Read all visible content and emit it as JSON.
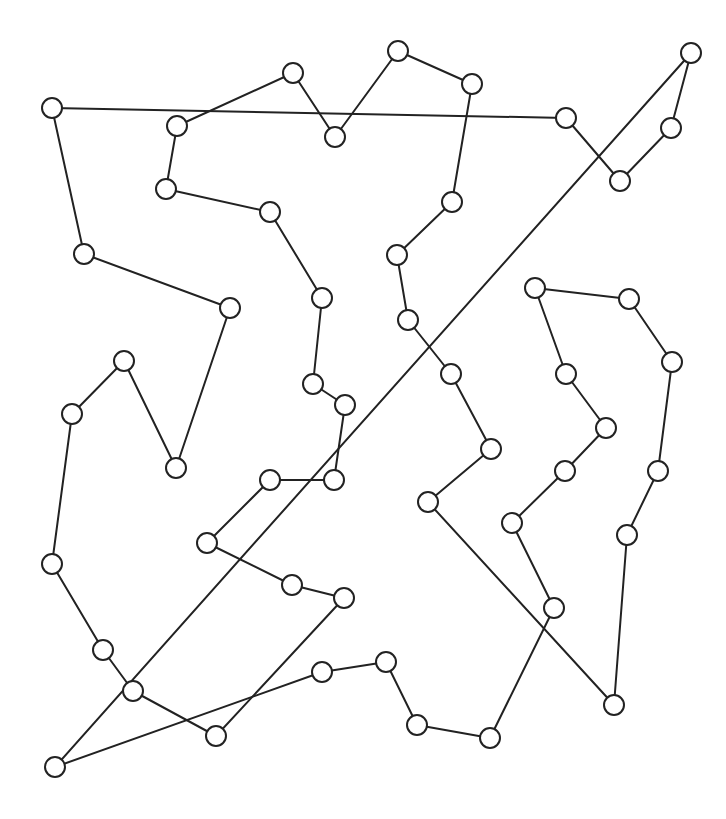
{
  "diagram": {
    "type": "tour-graph",
    "node_radius": 10,
    "colors": {
      "stroke": "#222222",
      "node_fill": "#ffffff",
      "background": "#ffffff"
    },
    "nodes": [
      {
        "id": "n1",
        "x": 52,
        "y": 108
      },
      {
        "id": "n2",
        "x": 566,
        "y": 118
      },
      {
        "id": "n3",
        "x": 620,
        "y": 181
      },
      {
        "id": "n4",
        "x": 671,
        "y": 128
      },
      {
        "id": "n5",
        "x": 691,
        "y": 53
      },
      {
        "id": "n6",
        "x": 55,
        "y": 767
      },
      {
        "id": "n7",
        "x": 216,
        "y": 736
      },
      {
        "id": "n8",
        "x": 344,
        "y": 598
      },
      {
        "id": "n9",
        "x": 292,
        "y": 585
      },
      {
        "id": "n10",
        "x": 207,
        "y": 543
      },
      {
        "id": "n11",
        "x": 270,
        "y": 480
      },
      {
        "id": "n12",
        "x": 334,
        "y": 480
      },
      {
        "id": "n13",
        "x": 345,
        "y": 405
      },
      {
        "id": "n14",
        "x": 313,
        "y": 384
      },
      {
        "id": "n15",
        "x": 322,
        "y": 298
      },
      {
        "id": "n16",
        "x": 270,
        "y": 212
      },
      {
        "id": "n17",
        "x": 166,
        "y": 189
      },
      {
        "id": "n18",
        "x": 177,
        "y": 126
      },
      {
        "id": "n19",
        "x": 293,
        "y": 73
      },
      {
        "id": "n20",
        "x": 335,
        "y": 137
      },
      {
        "id": "n21",
        "x": 398,
        "y": 51
      },
      {
        "id": "n22",
        "x": 472,
        "y": 84
      },
      {
        "id": "n23",
        "x": 452,
        "y": 202
      },
      {
        "id": "n24",
        "x": 397,
        "y": 255
      },
      {
        "id": "n25",
        "x": 408,
        "y": 320
      },
      {
        "id": "n26",
        "x": 451,
        "y": 374
      },
      {
        "id": "n27",
        "x": 491,
        "y": 449
      },
      {
        "id": "n28",
        "x": 428,
        "y": 502
      },
      {
        "id": "n29",
        "x": 614,
        "y": 705
      },
      {
        "id": "n30",
        "x": 627,
        "y": 535
      },
      {
        "id": "n31",
        "x": 658,
        "y": 471
      },
      {
        "id": "n32",
        "x": 672,
        "y": 362
      },
      {
        "id": "n33",
        "x": 629,
        "y": 299
      },
      {
        "id": "n34",
        "x": 535,
        "y": 288
      },
      {
        "id": "n35",
        "x": 566,
        "y": 374
      },
      {
        "id": "n36",
        "x": 606,
        "y": 428
      },
      {
        "id": "n37",
        "x": 565,
        "y": 471
      },
      {
        "id": "n38",
        "x": 512,
        "y": 523
      },
      {
        "id": "n39",
        "x": 554,
        "y": 608
      },
      {
        "id": "n40",
        "x": 490,
        "y": 738
      },
      {
        "id": "n41",
        "x": 417,
        "y": 725
      },
      {
        "id": "n42",
        "x": 386,
        "y": 662
      },
      {
        "id": "n43",
        "x": 322,
        "y": 672
      },
      {
        "id": "n44",
        "x": 133,
        "y": 691
      },
      {
        "id": "n45",
        "x": 103,
        "y": 650
      },
      {
        "id": "n46",
        "x": 52,
        "y": 564
      },
      {
        "id": "n47",
        "x": 72,
        "y": 414
      },
      {
        "id": "n48",
        "x": 124,
        "y": 361
      },
      {
        "id": "n49",
        "x": 176,
        "y": 468
      },
      {
        "id": "n50",
        "x": 230,
        "y": 308
      },
      {
        "id": "n51",
        "x": 84,
        "y": 254
      }
    ],
    "tour": [
      "n1",
      "n2",
      "n3",
      "n4",
      "n5",
      "n6",
      "n43",
      "n42",
      "n41",
      "n40",
      "n39",
      "n38",
      "n37",
      "n36",
      "n35",
      "n34",
      "n33",
      "n32",
      "n31",
      "n30",
      "n29",
      "n28",
      "n27",
      "n26",
      "n25",
      "n24",
      "n23",
      "n22",
      "n21",
      "n20",
      "n19",
      "n18",
      "n17",
      "n16",
      "n15",
      "n14",
      "n13",
      "n12",
      "n11",
      "n10",
      "n9",
      "n8",
      "n7",
      "n44",
      "n45",
      "n46",
      "n47",
      "n48",
      "n49",
      "n50",
      "n51",
      "n1"
    ]
  }
}
